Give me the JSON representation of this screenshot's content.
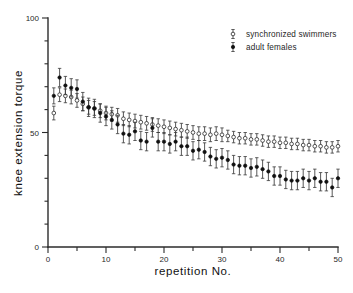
{
  "chart_data": {
    "type": "scatter",
    "title": "",
    "xlabel": "repetition   No.",
    "ylabel": "knee  extension  torque",
    "xlim": [
      0,
      50
    ],
    "ylim": [
      0,
      100
    ],
    "xticks": [
      0,
      10,
      20,
      30,
      40,
      50
    ],
    "yticks": [
      0,
      50,
      100
    ],
    "xtick_labels": [
      "0",
      "10",
      "20",
      "30",
      "40",
      "50"
    ],
    "ytick_labels": [
      "0",
      "50",
      "100"
    ],
    "grid": false,
    "legend_position": "top-right",
    "x": [
      1,
      2,
      3,
      4,
      5,
      6,
      7,
      8,
      9,
      10,
      11,
      12,
      13,
      14,
      15,
      16,
      17,
      18,
      19,
      20,
      21,
      22,
      23,
      24,
      25,
      26,
      27,
      28,
      29,
      30,
      31,
      32,
      33,
      34,
      35,
      36,
      37,
      38,
      39,
      40,
      41,
      42,
      43,
      44,
      45,
      46,
      47,
      48,
      49,
      50
    ],
    "series": [
      {
        "name": "synchronized swimmers",
        "marker": "open-circle",
        "values": [
          58.5,
          66.5,
          66.0,
          65.5,
          64.0,
          62.5,
          61.0,
          60.5,
          59.5,
          58.5,
          58.0,
          57.5,
          56.0,
          55.5,
          55.0,
          54.5,
          54.0,
          53.5,
          53.0,
          52.5,
          52.0,
          51.5,
          51.0,
          50.5,
          50.0,
          49.5,
          49.5,
          49.0,
          49.5,
          49.0,
          48.5,
          48.0,
          47.5,
          47.5,
          47.0,
          47.0,
          46.5,
          46.0,
          46.0,
          45.5,
          45.5,
          45.0,
          45.0,
          44.5,
          44.5,
          44.0,
          44.0,
          43.5,
          43.5,
          44.0
        ],
        "err_upper": [
          3.0,
          3.0,
          3.0,
          3.0,
          3.0,
          3.0,
          3.0,
          3.0,
          3.0,
          3.0,
          3.0,
          3.0,
          3.0,
          3.0,
          3.0,
          3.0,
          3.0,
          3.0,
          3.0,
          3.0,
          3.0,
          3.0,
          3.0,
          3.0,
          3.0,
          3.0,
          3.0,
          3.0,
          3.0,
          3.0,
          2.5,
          2.5,
          2.5,
          2.5,
          2.5,
          2.5,
          2.5,
          2.5,
          2.5,
          2.5,
          2.5,
          2.5,
          2.5,
          2.5,
          2.5,
          2.5,
          2.5,
          2.5,
          2.5,
          2.5
        ],
        "err_lower": [
          3.0,
          3.0,
          3.0,
          3.0,
          3.0,
          3.0,
          3.0,
          3.0,
          3.0,
          3.0,
          3.0,
          3.0,
          3.0,
          3.0,
          3.0,
          3.0,
          3.0,
          3.0,
          3.0,
          3.0,
          3.0,
          3.0,
          3.0,
          3.0,
          3.0,
          3.0,
          3.0,
          3.0,
          3.0,
          3.0,
          2.5,
          2.5,
          2.5,
          2.5,
          2.5,
          2.5,
          2.5,
          2.5,
          2.5,
          2.5,
          2.5,
          2.5,
          2.5,
          2.5,
          2.5,
          2.5,
          2.5,
          2.5,
          2.5,
          2.5
        ]
      },
      {
        "name": "adult females",
        "marker": "filled-circle",
        "values": [
          66.0,
          74.0,
          70.5,
          69.5,
          69.0,
          63.5,
          61.0,
          60.5,
          58.5,
          57.0,
          55.5,
          53.5,
          49.5,
          49.0,
          50.5,
          46.5,
          46.0,
          52.0,
          46.0,
          46.0,
          45.0,
          46.0,
          44.0,
          44.0,
          42.0,
          42.5,
          41.5,
          39.5,
          38.5,
          39.0,
          38.0,
          36.0,
          35.5,
          35.5,
          34.5,
          35.0,
          34.0,
          33.0,
          31.0,
          31.0,
          29.5,
          29.0,
          29.0,
          30.0,
          29.0,
          30.0,
          28.5,
          28.5,
          26.0,
          30.0
        ],
        "err_upper": [
          3.5,
          4.0,
          4.0,
          4.0,
          4.0,
          4.0,
          4.0,
          4.0,
          4.0,
          4.0,
          4.0,
          4.0,
          4.0,
          4.0,
          4.0,
          4.0,
          4.0,
          4.0,
          4.0,
          4.0,
          4.0,
          4.0,
          4.0,
          4.0,
          4.0,
          4.0,
          4.0,
          4.0,
          4.0,
          4.0,
          4.0,
          4.0,
          4.0,
          4.0,
          4.0,
          4.0,
          4.0,
          4.0,
          4.0,
          4.0,
          4.0,
          4.0,
          4.0,
          4.0,
          4.0,
          4.0,
          4.0,
          4.0,
          4.0,
          4.0
        ],
        "err_lower": [
          3.5,
          4.0,
          4.0,
          4.0,
          4.0,
          4.0,
          4.0,
          4.0,
          4.0,
          4.0,
          4.0,
          4.0,
          4.0,
          4.0,
          4.0,
          4.0,
          4.0,
          4.0,
          4.0,
          4.0,
          4.0,
          4.0,
          4.0,
          4.0,
          4.0,
          4.0,
          4.0,
          4.0,
          4.0,
          4.0,
          4.0,
          4.0,
          4.0,
          4.0,
          4.0,
          4.0,
          4.0,
          4.0,
          4.0,
          4.0,
          4.0,
          4.0,
          4.0,
          4.0,
          4.0,
          4.0,
          4.0,
          4.0,
          4.0,
          4.0
        ]
      }
    ],
    "legend": [
      {
        "label": "synchronized swimmers",
        "marker": "open-circle"
      },
      {
        "label": "adult females",
        "marker": "filled-circle"
      }
    ],
    "colors": {
      "axis": "#2b2b2b",
      "marker_open_fill": "#ffffff",
      "marker_open_stroke": "#2b2b2b",
      "marker_filled": "#101010",
      "errorbar": "#3a3a3a",
      "background": "#ffffff"
    }
  }
}
